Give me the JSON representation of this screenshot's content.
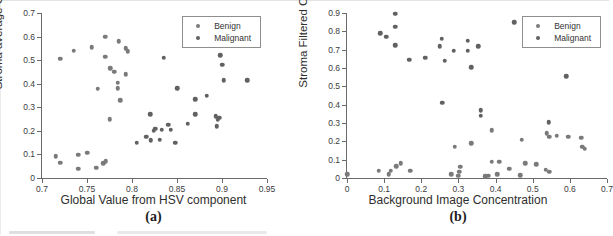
{
  "colors": {
    "benign": "#7a7a7a",
    "malignant": "#616161",
    "axis": "#6a6a6a",
    "text": "#2e2e2e"
  },
  "chart_data": [
    {
      "type": "scatter",
      "caption": "(a)",
      "xlabel": "Global Value from HSV component",
      "ylabel": "Stroma average Concentration",
      "xlim": [
        0.7,
        0.95
      ],
      "ylim": [
        0,
        0.7
      ],
      "xticks": [
        "0.7",
        "0.75",
        "0.8",
        "0.85",
        "0.9",
        "0.95"
      ],
      "yticks": [
        "0",
        "0.1",
        "0.2",
        "0.3",
        "0.4",
        "0.5",
        "0.6",
        "0.7"
      ],
      "legend_position": "top-right",
      "grid": false,
      "series": [
        {
          "name": "Benign",
          "color": "#7a7a7a",
          "points": [
            [
              0.72,
              0.505
            ],
            [
              0.735,
              0.54
            ],
            [
              0.755,
              0.555
            ],
            [
              0.77,
              0.6
            ],
            [
              0.77,
              0.515
            ],
            [
              0.776,
              0.465
            ],
            [
              0.785,
              0.58
            ],
            [
              0.793,
              0.55
            ],
            [
              0.795,
              0.537
            ],
            [
              0.78,
              0.45
            ],
            [
              0.793,
              0.44
            ],
            [
              0.784,
              0.405
            ],
            [
              0.784,
              0.38
            ],
            [
              0.762,
              0.378
            ],
            [
              0.787,
              0.33
            ],
            [
              0.775,
              0.25
            ],
            [
              0.715,
              0.093
            ],
            [
              0.72,
              0.065
            ],
            [
              0.74,
              0.098
            ],
            [
              0.74,
              0.04
            ],
            [
              0.75,
              0.108
            ],
            [
              0.76,
              0.043
            ],
            [
              0.768,
              0.062
            ],
            [
              0.771,
              0.072
            ]
          ]
        },
        {
          "name": "Malignant",
          "color": "#616161",
          "points": [
            [
              0.82,
              0.27
            ],
            [
              0.805,
              0.15
            ],
            [
              0.816,
              0.175
            ],
            [
              0.821,
              0.16
            ],
            [
              0.824,
              0.2
            ],
            [
              0.826,
              0.21
            ],
            [
              0.831,
              0.162
            ],
            [
              0.833,
              0.205
            ],
            [
              0.84,
              0.225
            ],
            [
              0.843,
              0.205
            ],
            [
              0.848,
              0.15
            ],
            [
              0.835,
              0.51
            ],
            [
              0.85,
              0.38
            ],
            [
              0.862,
              0.23
            ],
            [
              0.87,
              0.27
            ],
            [
              0.87,
              0.335
            ],
            [
              0.883,
              0.35
            ],
            [
              0.877,
              0.612
            ],
            [
              0.885,
              0.598
            ],
            [
              0.878,
              0.572
            ],
            [
              0.891,
              0.578
            ],
            [
              0.895,
              0.576
            ],
            [
              0.894,
              0.655
            ],
            [
              0.898,
              0.52
            ],
            [
              0.9,
              0.48
            ],
            [
              0.902,
              0.415
            ],
            [
              0.928,
              0.415
            ],
            [
              0.893,
              0.262
            ],
            [
              0.897,
              0.255
            ],
            [
              0.895,
              0.247
            ],
            [
              0.894,
              0.22
            ]
          ]
        }
      ]
    },
    {
      "type": "scatter",
      "caption": "(b)",
      "xlabel": "Background Image Concentration",
      "ylabel": "Stroma Filtered Concentration",
      "xlim": [
        0,
        0.7
      ],
      "ylim": [
        0,
        0.9
      ],
      "xticks": [
        "0",
        "0.1",
        "0.2",
        "0.3",
        "0.4",
        "0.5",
        "0.6",
        "0.7"
      ],
      "yticks": [
        "0",
        "0.1",
        "0.2",
        "0.3",
        "0.4",
        "0.5",
        "0.6",
        "0.7",
        "0.8",
        "0.9"
      ],
      "legend_position": "top-right",
      "grid": false,
      "series": [
        {
          "name": "Benign",
          "color": "#7a7a7a",
          "points": [
            [
              0.39,
              0.26
            ],
            [
              0.29,
              0.17
            ],
            [
              0.335,
              0.19
            ],
            [
              0.47,
              0.21
            ],
            [
              0.538,
              0.245
            ],
            [
              0.545,
              0.225
            ],
            [
              0.565,
              0.23
            ],
            [
              0.595,
              0.225
            ],
            [
              0.63,
              0.22
            ],
            [
              0.633,
              0.17
            ],
            [
              0.64,
              0.16
            ],
            [
              0.0,
              0.02
            ],
            [
              0.085,
              0.04
            ],
            [
              0.112,
              0.02
            ],
            [
              0.118,
              0.04
            ],
            [
              0.133,
              0.065
            ],
            [
              0.145,
              0.08
            ],
            [
              0.17,
              0.04
            ],
            [
              0.28,
              0.02
            ],
            [
              0.3,
              0.012
            ],
            [
              0.302,
              0.035
            ],
            [
              0.305,
              0.062
            ],
            [
              0.372,
              0.01
            ],
            [
              0.38,
              0.012
            ],
            [
              0.405,
              0.02
            ],
            [
              0.437,
              0.05
            ],
            [
              0.467,
              0.015
            ],
            [
              0.48,
              0.08
            ],
            [
              0.51,
              0.075
            ],
            [
              0.535,
              0.045
            ],
            [
              0.545,
              0.035
            ],
            [
              0.39,
              0.09
            ],
            [
              0.41,
              0.09
            ]
          ]
        },
        {
          "name": "Malignant",
          "color": "#616161",
          "points": [
            [
              0.13,
              0.895
            ],
            [
              0.13,
              0.825
            ],
            [
              0.09,
              0.79
            ],
            [
              0.105,
              0.77
            ],
            [
              0.13,
              0.725
            ],
            [
              0.168,
              0.645
            ],
            [
              0.21,
              0.655
            ],
            [
              0.25,
              0.72
            ],
            [
              0.255,
              0.76
            ],
            [
              0.263,
              0.64
            ],
            [
              0.287,
              0.695
            ],
            [
              0.325,
              0.75
            ],
            [
              0.325,
              0.695
            ],
            [
              0.354,
              0.72
            ],
            [
              0.334,
              0.605
            ],
            [
              0.45,
              0.85
            ],
            [
              0.495,
              0.8
            ],
            [
              0.59,
              0.555
            ],
            [
              0.257,
              0.41
            ],
            [
              0.36,
              0.37
            ],
            [
              0.36,
              0.34
            ],
            [
              0.543,
              0.305
            ]
          ]
        }
      ]
    }
  ]
}
